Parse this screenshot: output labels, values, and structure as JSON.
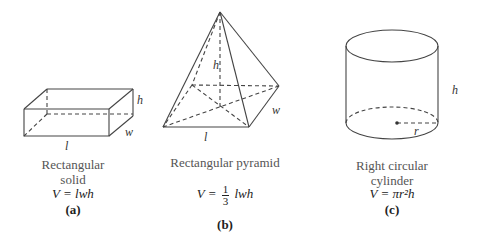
{
  "figures": [
    {
      "id": "a",
      "name": "Rectangular solid",
      "caption_lines": [
        "Rectangular",
        "solid"
      ],
      "formula": "V = lwh",
      "tag": "(a)",
      "labels": {
        "length": "l",
        "width": "w",
        "height": "h"
      }
    },
    {
      "id": "b",
      "name": "Rectangular pyramid",
      "caption_lines": [
        "Rectangular pyramid"
      ],
      "formula_left": "V =",
      "formula_num": "1",
      "formula_den": "3",
      "formula_right": "lwh",
      "tag": "(b)",
      "labels": {
        "length": "l",
        "width": "w",
        "height": "h"
      }
    },
    {
      "id": "c",
      "name": "Right circular cylinder",
      "caption_lines": [
        "Right circular",
        "cylinder"
      ],
      "formula": "V = πr²h",
      "tag": "(c)",
      "labels": {
        "radius": "r",
        "height": "h"
      }
    }
  ]
}
